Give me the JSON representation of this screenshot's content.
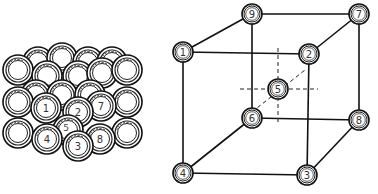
{
  "figure": {
    "left_panel": {
      "description": "Packed sphere model of body-centered cubic lattice",
      "labels": [
        "1",
        "2",
        "7",
        "4",
        "5",
        "3",
        "8"
      ]
    },
    "right_panel": {
      "description": "Ball-and-stick unit cell of body-centered cubic lattice",
      "nodes": {
        "front_top_left": "1",
        "front_top_right": "2",
        "front_bottom_right": "3",
        "front_bottom_left": "4",
        "center": "5",
        "back_bottom_left": "6",
        "back_top_right": "7",
        "back_bottom_right": "8",
        "back_top_left": "9"
      }
    }
  },
  "colors": {
    "line": "#111111",
    "sphere_fill": "#ffffff",
    "sphere_ring": "#222222",
    "background": "#ffffff"
  }
}
